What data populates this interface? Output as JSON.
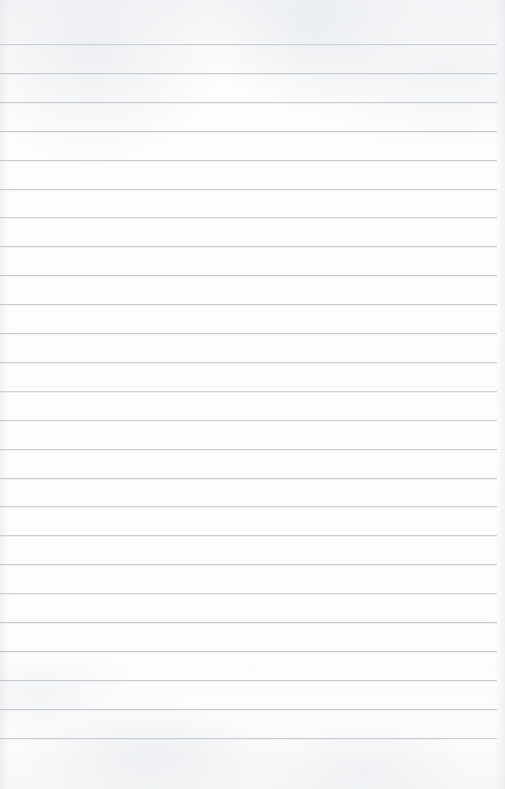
{
  "document": {
    "kind": "lined-notebook-paper",
    "title": "Blank ruled notebook page",
    "text_content": "",
    "has_handwriting": false,
    "has_printed_text": false,
    "orientation": "portrait"
  },
  "page": {
    "width": 505,
    "height": 789,
    "background_color": "#fdfdfd",
    "paper_tint_top": "#f4f5f7",
    "edge_shadow_color": "#e4e7ea"
  },
  "ruling": {
    "line_color": "#c9cdd1",
    "line_thickness": 1,
    "line_spacing": 28.9,
    "first_line_y": 44,
    "line_start_x": 0,
    "line_end_x": 497,
    "line_count": 25,
    "top_margin_height": 44,
    "bottom_margin_height": 51,
    "has_vertical_margin_rule": false,
    "line_y_positions": [
      44,
      72.9,
      101.8,
      130.7,
      159.6,
      188.5,
      217.4,
      246.3,
      275.2,
      304.1,
      333,
      361.9,
      390.8,
      419.7,
      448.6,
      477.5,
      506.4,
      535.3,
      564.2,
      593.1,
      622,
      650.9,
      679.8,
      708.7,
      737.6
    ]
  },
  "accessibility": {
    "page_description": "A blank sheet of lined notebook paper with 25 evenly spaced light gray horizontal ruled lines and no writing."
  }
}
